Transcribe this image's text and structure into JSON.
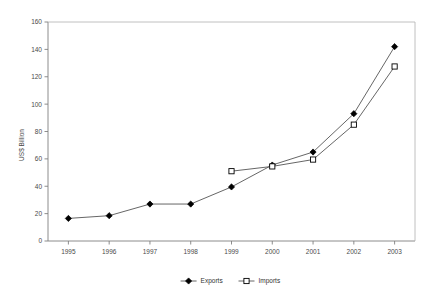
{
  "chart_data": {
    "type": "line",
    "title": "",
    "xlabel": "",
    "ylabel": "US$ Billion",
    "categories": [
      "1995",
      "1996",
      "1997",
      "1998",
      "1999",
      "2000",
      "2001",
      "2002",
      "2003"
    ],
    "ylim": [
      0,
      160
    ],
    "y_ticks": [
      "0",
      "20",
      "40",
      "60",
      "80",
      "100",
      "120",
      "140",
      "160"
    ],
    "grid": false,
    "legend_position": "bottom-center",
    "series": [
      {
        "name": "Exports",
        "marker": "filled-diamond",
        "values": [
          16.5,
          18.5,
          27,
          27,
          39.5,
          55.5,
          65,
          93,
          142
        ]
      },
      {
        "name": "Imports",
        "marker": "open-square",
        "values": [
          null,
          null,
          null,
          null,
          51,
          54.5,
          59.5,
          85,
          127.5
        ]
      }
    ]
  },
  "legend": {
    "items": [
      {
        "label": "Exports",
        "marker": "filled-diamond"
      },
      {
        "label": "Imports",
        "marker": "open-square"
      }
    ]
  }
}
